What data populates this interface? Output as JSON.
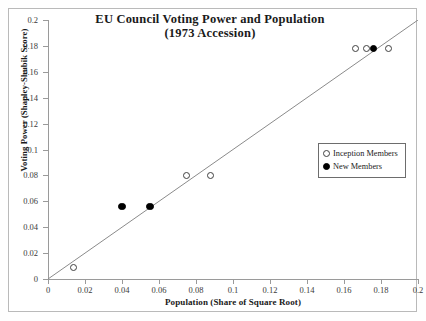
{
  "chart_data": {
    "type": "scatter",
    "title": "EU Council Voting Power and Population",
    "subtitle": "(1973 Accession)",
    "xlabel": "Population  (Share of Square Root)",
    "ylabel": "Voting Power (Shapley-Shubik Score)",
    "xlim": [
      0,
      0.2
    ],
    "ylim": [
      0,
      0.2
    ],
    "xticks": [
      "0",
      "0.02",
      "0.04",
      "0.06",
      "0.08",
      "0.1",
      "0.12",
      "0.14",
      "0.16",
      "0.18",
      "0.2"
    ],
    "yticks": [
      "0",
      "0.02",
      "0.04",
      "0.06",
      "0.08",
      "0.1",
      "0.12",
      "0.14",
      "0.16",
      "0.18",
      "0.2"
    ],
    "xtick_values": [
      0,
      0.02,
      0.04,
      0.06,
      0.08,
      0.1,
      0.12,
      0.14,
      0.16,
      0.18,
      0.2
    ],
    "ytick_values": [
      0,
      0.02,
      0.04,
      0.06,
      0.08,
      0.1,
      0.12,
      0.14,
      0.16,
      0.18,
      0.2
    ],
    "grid": false,
    "legend_position": "center-right",
    "reference_line": {
      "name": "45-degree-line",
      "from": [
        0,
        0
      ],
      "to": [
        0.2,
        0.2
      ],
      "color": "#8a8a8a"
    },
    "series": [
      {
        "name": "Inception Members",
        "marker": "open-circle",
        "color": "#404040",
        "points": [
          {
            "x": 0.014,
            "y": 0.009
          },
          {
            "x": 0.075,
            "y": 0.08
          },
          {
            "x": 0.088,
            "y": 0.08
          },
          {
            "x": 0.166,
            "y": 0.178
          },
          {
            "x": 0.172,
            "y": 0.178
          },
          {
            "x": 0.184,
            "y": 0.178
          }
        ]
      },
      {
        "name": "New Members",
        "marker": "filled-circle",
        "color": "#000000",
        "points": [
          {
            "x": 0.04,
            "y": 0.056
          },
          {
            "x": 0.055,
            "y": 0.056
          },
          {
            "x": 0.176,
            "y": 0.178
          }
        ]
      }
    ]
  },
  "legend": {
    "items": [
      {
        "label": "Inception Members",
        "marker": "open-circle"
      },
      {
        "label": "New Members",
        "marker": "filled-circle"
      }
    ]
  }
}
